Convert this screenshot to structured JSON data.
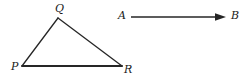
{
  "figure": {
    "width": 250,
    "height": 83,
    "background_color": "#ffffff",
    "stroke_color": "#262626",
    "label_color": "#1a1a1a",
    "triangle": {
      "name": "triangle-PQR",
      "stroke_width": 1.3,
      "base_stroke_width": 1.9,
      "vertices": [
        {
          "id": "P",
          "label": "P",
          "x": 22,
          "y": 66,
          "label_x": 11,
          "label_y": 61
        },
        {
          "id": "Q",
          "label": "Q",
          "x": 58,
          "y": 18,
          "label_x": 55,
          "label_y": 3
        },
        {
          "id": "R",
          "label": "R",
          "x": 122,
          "y": 66,
          "label_x": 124,
          "label_y": 64
        }
      ],
      "edges": [
        {
          "id": "PQ",
          "from": "P",
          "to": "Q"
        },
        {
          "id": "QR",
          "from": "Q",
          "to": "R"
        },
        {
          "id": "PR",
          "from": "P",
          "to": "R"
        }
      ]
    },
    "arrow": {
      "name": "arrow-AB",
      "stroke_width": 1.4,
      "tail_x": 131,
      "tail_y": 17,
      "tip_x": 226,
      "tip_y": 17,
      "head_length": 9,
      "head_width": 7,
      "endpoints": [
        {
          "id": "A",
          "label": "A",
          "label_x": 118,
          "label_y": 10
        },
        {
          "id": "B",
          "label": "B",
          "label_x": 231,
          "label_y": 10
        }
      ]
    }
  }
}
